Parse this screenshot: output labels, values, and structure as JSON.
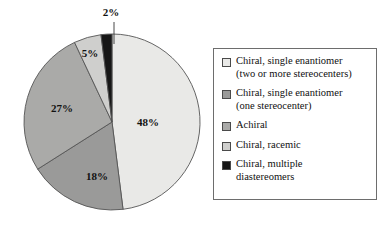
{
  "chart_data": {
    "type": "pie",
    "title": "",
    "subtitle": "",
    "xlabel": "",
    "ylabel": "",
    "grid": false,
    "legend_position": "right",
    "unit": "%",
    "start_angle_deg": 0,
    "direction": "clockwise",
    "categories": [
      "Chiral, single enantiomer (two or more stereocenters)",
      "Chiral, single enantiomer (one stereocenter)",
      "Achiral",
      "Chiral, racemic",
      "Chiral, multiple diastereomers"
    ],
    "values": [
      48,
      18,
      27,
      5,
      2
    ],
    "labels": [
      "48%",
      "18%",
      "27%",
      "5%",
      "2%"
    ],
    "colors": [
      "#e9e9e7",
      "#9a9a99",
      "#aaaaa8",
      "#cfcfcd",
      "#161616"
    ],
    "slices": [
      {
        "name": "chiral-single-enantiomer-multi",
        "value": 48,
        "label": "48%",
        "color": "#e9e9e7",
        "label_x": 148,
        "label_y": 126,
        "leader": false
      },
      {
        "name": "chiral-single-enantiomer-one",
        "value": 18,
        "label": "18%",
        "color": "#9a9a99",
        "label_x": 97,
        "label_y": 180,
        "leader": false
      },
      {
        "name": "achiral",
        "value": 27,
        "label": "27%",
        "color": "#aaaaa8",
        "label_x": 62,
        "label_y": 112,
        "leader": false
      },
      {
        "name": "chiral-racemic",
        "value": 5,
        "label": "5%",
        "color": "#cfcfcd",
        "label_x": 90,
        "label_y": 57,
        "leader": false
      },
      {
        "name": "chiral-multiple-diastereomers",
        "value": 2,
        "label": "2%",
        "color": "#161616",
        "label_x": 111,
        "label_y": 16,
        "leader": true,
        "leader_x1": 114,
        "leader_y1": 22,
        "leader_x2": 114,
        "leader_y2": 44
      }
    ],
    "geometry": {
      "center_x": 112,
      "center_y": 122,
      "radius": 88
    },
    "stroke_color": "#555555",
    "background": "#ffffff"
  },
  "legend": {
    "border_color": "#6d6d6d",
    "items": [
      {
        "swatch_name": "legend-swatch-chiral-single-multi",
        "color": "#e9e9e7",
        "label": "Chiral, single enantiomer\n(two or more stereocenters)"
      },
      {
        "swatch_name": "legend-swatch-chiral-single-one",
        "color": "#9a9a99",
        "label": "Chiral, single enantiomer\n(one stereocenter)"
      },
      {
        "swatch_name": "legend-swatch-achiral",
        "color": "#aaaaa8",
        "label": " Achiral"
      },
      {
        "swatch_name": "legend-swatch-chiral-racemic",
        "color": "#cfcfcd",
        "label": "Chiral, racemic"
      },
      {
        "swatch_name": "legend-swatch-chiral-multiple",
        "color": "#161616",
        "label": "Chiral, multiple\ndiastereomers"
      }
    ]
  }
}
